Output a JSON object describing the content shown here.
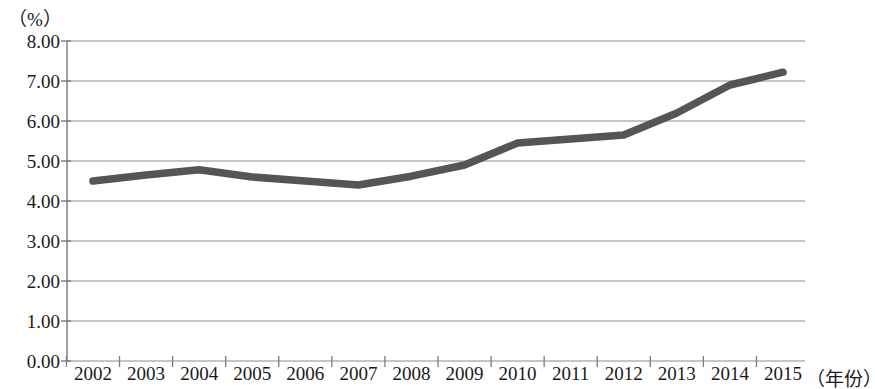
{
  "chart_data": {
    "type": "line",
    "title": "",
    "unit_label": "（%）",
    "xlabel": "（年份）",
    "ylabel": "",
    "categories": [
      "2002",
      "2003",
      "2004",
      "2005",
      "2006",
      "2007",
      "2008",
      "2009",
      "2010",
      "2011",
      "2012",
      "2013",
      "2014",
      "2015"
    ],
    "values": [
      4.5,
      4.65,
      4.78,
      4.6,
      4.5,
      4.4,
      4.62,
      4.9,
      5.45,
      5.55,
      5.65,
      6.2,
      6.9,
      7.22
    ],
    "series": [
      {
        "name": "",
        "values": [
          4.5,
          4.65,
          4.78,
          4.6,
          4.5,
          4.4,
          4.62,
          4.9,
          5.45,
          5.55,
          5.65,
          6.2,
          6.9,
          7.22
        ]
      }
    ],
    "ylim": [
      0.0,
      8.0
    ],
    "ytick_labels": [
      "8.00",
      "7.00",
      "6.00",
      "5.00",
      "4.00",
      "3.00",
      "2.00",
      "1.00",
      "0.00"
    ],
    "ytick_values": [
      8.0,
      7.0,
      6.0,
      5.0,
      4.0,
      3.0,
      2.0,
      1.0,
      0.0
    ],
    "grid": true,
    "legend": "none",
    "line_color": "#555555",
    "grid_color": "#8c8c8c",
    "axis_color": "#7a7a7a",
    "background_color": "#ffffff"
  }
}
